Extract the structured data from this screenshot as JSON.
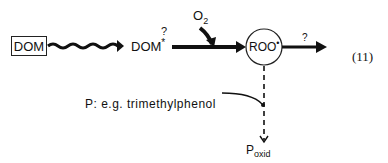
{
  "diagram": {
    "start_node": "DOM",
    "excited_node": "DOM",
    "excited_superscript": "*",
    "excited_question": "?",
    "oxygen_label": "O",
    "oxygen_subscript": "2",
    "radical_node": "ROO",
    "radical_superscript": "•",
    "output_question": "?",
    "probe_label": "P: e.g. trimethylphenol",
    "product_label": "P",
    "product_subscript": "oxid",
    "equation_number": "(11)"
  }
}
